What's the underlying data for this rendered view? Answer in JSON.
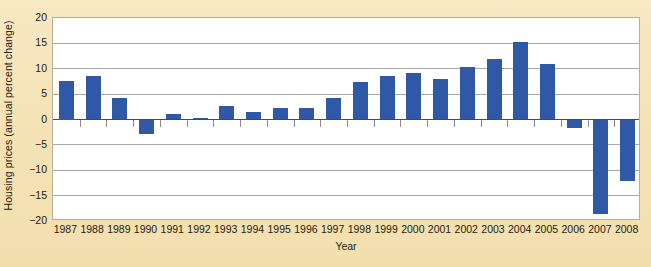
{
  "chart_data": {
    "type": "bar",
    "title": "",
    "xlabel": "Year",
    "ylabel": "Housing prices (annual percent change)",
    "ylim": [
      -20,
      20
    ],
    "yticks": [
      20,
      15,
      10,
      5,
      0,
      -5,
      -10,
      -15,
      -20
    ],
    "ytick_labels": [
      "20",
      "15",
      "10",
      "5",
      "0",
      "−5",
      "−10",
      "−15",
      "−20"
    ],
    "grid": true,
    "legend": "none",
    "bar_color": "#2f58a7",
    "plot_background": "#ffffff",
    "figure_background": "#f6e4b9",
    "categories": [
      "1987",
      "1988",
      "1989",
      "1990",
      "1991",
      "1992",
      "1993",
      "1994",
      "1995",
      "1996",
      "1997",
      "1998",
      "1999",
      "2000",
      "2001",
      "2002",
      "2003",
      "2004",
      "2005",
      "2006",
      "2007",
      "2008"
    ],
    "values": [
      7.5,
      8.6,
      4.3,
      -2.8,
      1.0,
      0.2,
      2.7,
      1.5,
      2.2,
      2.3,
      4.2,
      7.4,
      8.5,
      9.2,
      8.0,
      10.3,
      11.9,
      15.3,
      11.0,
      -1.6,
      -18.6,
      -12.2
    ]
  }
}
